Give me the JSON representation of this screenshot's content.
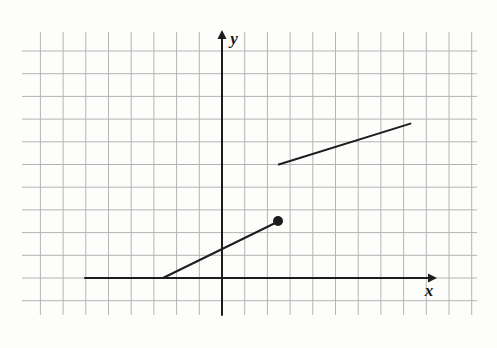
{
  "figure": {
    "background_color": "#fdfdfc",
    "grid": {
      "line_color": "#b4b4b4",
      "line_width": 1,
      "spacing_px": 22.7,
      "origin_px": {
        "x": 222,
        "y": 278
      },
      "x_start_px": 22,
      "x_end_px": 477,
      "y_start_px": 32,
      "y_end_px": 315,
      "columns": 21,
      "rows": 13,
      "visible": true
    },
    "axes": {
      "color": "#1d1d1d",
      "line_width": 2,
      "x_axis": {
        "label": "x",
        "label_pos_px": {
          "x": 429,
          "y": 296
        },
        "start_px": {
          "x": 85,
          "y": 278
        },
        "end_px": {
          "x": 437,
          "y": 278
        },
        "arrow": "right"
      },
      "y_axis": {
        "label": "y",
        "label_pos_px": {
          "x": 234,
          "y": 44
        },
        "start_px": {
          "x": 222,
          "y": 315
        },
        "end_px": {
          "x": 222,
          "y": 30
        },
        "arrow": "up"
      }
    }
  },
  "chart_data": {
    "type": "line",
    "xlabel": "x",
    "ylabel": "y",
    "grid": true,
    "legend": false,
    "axis_units": "1 grid square = 1 unit",
    "xlim": [
      -8.8,
      11.2
    ],
    "ylim": [
      -1.6,
      10.8
    ],
    "origin": [
      0,
      0
    ],
    "series": [
      {
        "name": "constant-ray",
        "description": "Horizontal ray along the x-axis extending left",
        "points": [
          [
            -6.0,
            0.0
          ],
          [
            -2.6,
            0.0
          ]
        ],
        "endpoint_left": "ray",
        "endpoint_right": "open-joined",
        "color": "#1d1d1d",
        "width": 2
      },
      {
        "name": "rising-segment-lower",
        "description": "Rising line segment from the x-axis up to the closed dot",
        "points": [
          [
            -2.6,
            0.0
          ],
          [
            2.5,
            2.5
          ]
        ],
        "slope": 0.5,
        "endpoint_left": "none",
        "endpoint_right": "closed-dot",
        "color": "#1d1d1d",
        "width": 2
      },
      {
        "name": "rising-segment-upper",
        "description": "Second rising line segment after the jump discontinuity",
        "points": [
          [
            2.5,
            5.0
          ],
          [
            8.3,
            6.8
          ]
        ],
        "slope": 0.31,
        "endpoint_left": "open",
        "endpoint_right": "open",
        "color": "#1d1d1d",
        "width": 2
      }
    ],
    "markers": [
      {
        "name": "closed-dot",
        "kind": "filled-circle",
        "x": 2.5,
        "y": 2.5,
        "pixel": {
          "x": 278,
          "y": 221
        },
        "radius_px": 5,
        "color": "#1d1d1d"
      }
    ],
    "annotations": [
      {
        "name": "jump-discontinuity",
        "at_x": 2.5,
        "from_y": 2.5,
        "to_y": 5.0
      }
    ]
  }
}
